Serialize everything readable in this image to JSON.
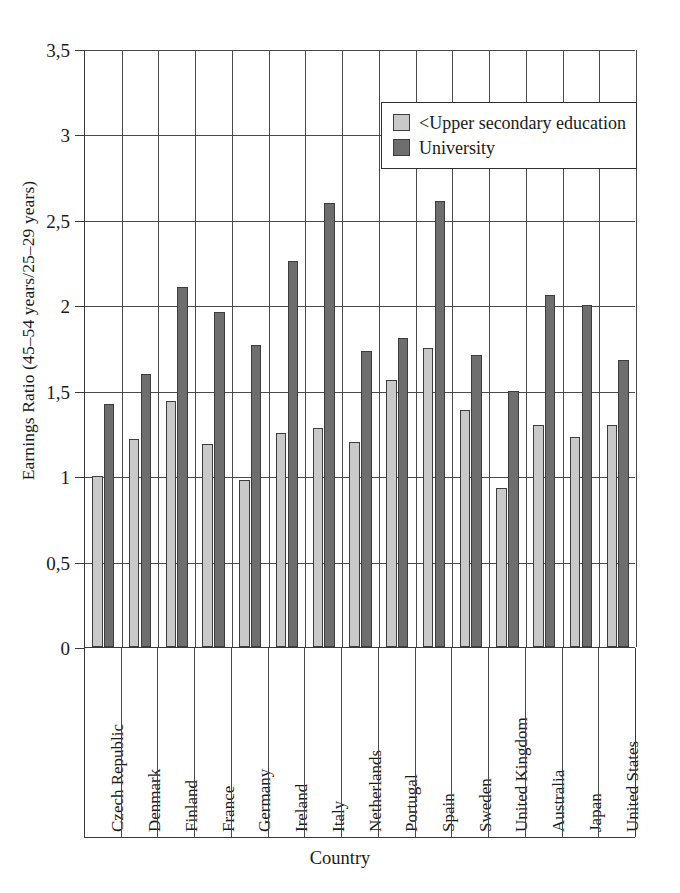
{
  "chart_data": {
    "type": "bar",
    "title": "",
    "xlabel": "Country",
    "ylabel": "Earnings Ratio (45–54 years/25–29 years)",
    "ylim": [
      0,
      3.5
    ],
    "ytick_values": [
      0,
      0.5,
      1,
      1.5,
      2,
      2.5,
      3,
      3.5
    ],
    "ytick_labels": [
      "0",
      "0,5",
      "1",
      "1,5",
      "2",
      "2,5",
      "3",
      "3,5"
    ],
    "grid": "horizontal-and-vertical",
    "legend_position": "top-right-inside",
    "categories": [
      "Czech Republic",
      "Denmark",
      "Finland",
      "France",
      "Germany",
      "Ireland",
      "Italy",
      "Netherlands",
      "Portugal",
      "Spain",
      "Sweden",
      "United Kingdom",
      "Australia",
      "Japan",
      "United States"
    ],
    "series": [
      {
        "name": "<Upper secondary education",
        "color": "#c9c9c9",
        "values": [
          1.0,
          1.22,
          1.44,
          1.19,
          0.98,
          1.25,
          1.28,
          1.2,
          1.56,
          1.75,
          1.39,
          0.93,
          1.3,
          1.23,
          1.3
        ]
      },
      {
        "name": "University",
        "color": "#6e6e6e",
        "values": [
          1.42,
          1.6,
          2.11,
          1.96,
          1.77,
          2.26,
          2.6,
          1.73,
          1.81,
          2.61,
          1.71,
          1.5,
          2.06,
          2.0,
          1.68
        ]
      }
    ]
  }
}
